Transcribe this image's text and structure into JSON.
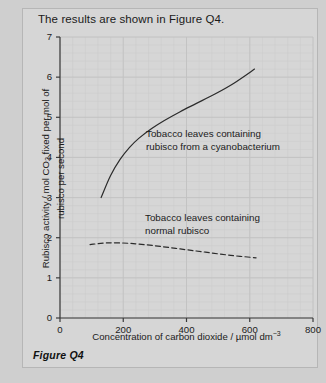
{
  "header": {
    "text": "The results are shown in Figure Q4."
  },
  "caption": {
    "text": "Figure Q4"
  },
  "colors": {
    "page_background": "#cfcfcf",
    "panel_background": "#d6d6d6",
    "panel_border": "#b6b6b6",
    "axis": "#3a3a3a",
    "major_grid": "#c2c2c2",
    "minor_grid": "#cbcbcb",
    "curve": "#2b2b2b",
    "text": "#1b1b1b"
  },
  "chart_data": {
    "type": "line",
    "title": "",
    "xlabel": "Concentration of carbon dioxide / µmol dm⁻³",
    "ylabel_line1": "Rubisco activity / mol CO₂ fixed per mol of",
    "ylabel_line2": "rubisco per second",
    "xlim": [
      0,
      800
    ],
    "ylim": [
      0,
      7
    ],
    "xticks": [
      0,
      200,
      400,
      600,
      800
    ],
    "yticks": [
      0,
      1,
      2,
      3,
      4,
      5,
      6,
      7
    ],
    "xtick_labels": [
      "0",
      "200",
      "400",
      "600",
      "800"
    ],
    "ytick_labels": [
      "0",
      "1",
      "2",
      "3",
      "4",
      "5",
      "6",
      "7"
    ],
    "grid": true,
    "minor_grid": true,
    "minor_grid_step_x": 40,
    "minor_grid_step_y": 0.2,
    "legend": "annotations",
    "series": [
      {
        "name": "Tobacco leaves containing rubisco from a cyanobacterium",
        "style": "solid",
        "x": [
          130,
          160,
          190,
          220,
          250,
          290,
          330,
          380,
          430,
          490,
          550,
          615
        ],
        "y": [
          3.0,
          3.55,
          3.95,
          4.25,
          4.48,
          4.72,
          4.92,
          5.14,
          5.34,
          5.58,
          5.85,
          6.2
        ]
      },
      {
        "name": "Tobacco leaves containing normal rubisco",
        "style": "dashed",
        "x": [
          95,
          150,
          220,
          300,
          380,
          460,
          540,
          620
        ],
        "y": [
          1.83,
          1.87,
          1.86,
          1.8,
          1.72,
          1.64,
          1.56,
          1.5
        ]
      }
    ],
    "annotations": [
      {
        "id": "annotation-cyanobacterium",
        "line1": "Tobacco leaves containing",
        "line2": "rubisco from a cyanobacterium",
        "x_px": 146,
        "y_px": 128
      },
      {
        "id": "annotation-normal-rubisco",
        "line1": "Tobacco leaves containing",
        "line2": "normal rubisco",
        "x_px": 145,
        "y_px": 212
      }
    ]
  }
}
